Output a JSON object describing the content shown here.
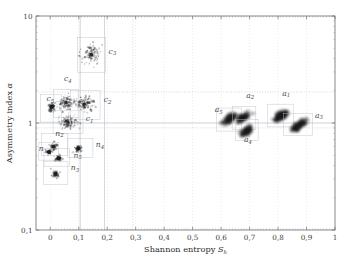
{
  "chart_data": {
    "type": "scatter",
    "title": "",
    "xlabel": "Shannon entropy S_h",
    "ylabel": "Asymmetry index α",
    "xlabel_main": "Shannon entropy",
    "xlabel_sym": "S",
    "xlabel_sub": "h",
    "ylabel_main": "Asymmetry index",
    "ylabel_sym": "α",
    "xlim": [
      -0.05,
      1.0
    ],
    "ylim": [
      0.1,
      10
    ],
    "yscale": "log",
    "xscale": "linear",
    "grid": true,
    "legend": "none",
    "xticks": [
      "0",
      "0,1",
      "0,2",
      "0,3",
      "0,4",
      "0,5",
      "0,6",
      "0,7",
      "0,8",
      "0,9",
      "1"
    ],
    "xtickvals": [
      0,
      0.1,
      0.2,
      0.3,
      0.4,
      0.5,
      0.6,
      0.7,
      0.8,
      0.9,
      1.0
    ],
    "yticks": [
      "0,1",
      "1",
      "10"
    ],
    "ytickvals": [
      0.1,
      1,
      10
    ],
    "reference_lines": [
      {
        "axis": "y",
        "value": 1.0,
        "style": "solid"
      },
      {
        "axis": "y",
        "value": 0.9,
        "style": "dotted"
      },
      {
        "axis": "y",
        "value": 1.95,
        "style": "dotted"
      },
      {
        "axis": "x",
        "value": 0.105,
        "style": "solid"
      },
      {
        "axis": "x",
        "value": 0.19,
        "style": "solid"
      },
      {
        "axis": "x",
        "value": 0.29,
        "style": "dotted"
      }
    ],
    "clusters": [
      {
        "id": "c3",
        "label": "c",
        "sub": "3",
        "x": 0.145,
        "y": 4.35,
        "box": [
          0.095,
          2.95,
          0.195,
          6.3
        ],
        "lx": 0.205,
        "ly": 4.45,
        "kind": "streak",
        "spread": 0.03,
        "n": 120
      },
      {
        "id": "c4",
        "label": "c",
        "sub": "4",
        "x": 0.055,
        "y": 1.55,
        "box": [
          0.012,
          1.12,
          0.098,
          2.05
        ],
        "lx": 0.048,
        "ly": 2.45,
        "kind": "streak",
        "spread": 0.026,
        "n": 110
      },
      {
        "id": "c5",
        "label": "c",
        "sub": "5",
        "x": 0.005,
        "y": 1.42,
        "box": [
          -0.035,
          1.02,
          0.04,
          1.85
        ],
        "lx": -0.013,
        "ly": 1.6,
        "kind": "blob",
        "spread": 0.016,
        "n": 70
      },
      {
        "id": "c2",
        "label": "c",
        "sub": "2",
        "x": 0.12,
        "y": 1.5,
        "box": [
          0.072,
          1.08,
          0.175,
          2.02
        ],
        "lx": 0.188,
        "ly": 1.56,
        "kind": "streak",
        "spread": 0.03,
        "n": 130
      },
      {
        "id": "c1",
        "label": "c",
        "sub": "1",
        "x": 0.062,
        "y": 1.02,
        "box": [
          0.01,
          0.8,
          0.115,
          1.3
        ],
        "lx": 0.125,
        "ly": 1.04,
        "kind": "streak",
        "spread": 0.026,
        "n": 120
      },
      {
        "id": "n2",
        "label": "n",
        "sub": "2",
        "x": 0.012,
        "y": 0.6,
        "box": [
          -0.03,
          0.5,
          0.062,
          0.8
        ],
        "lx": 0.018,
        "ly": 0.76,
        "kind": "point",
        "spread": 0.01,
        "n": 40
      },
      {
        "id": "n1",
        "label": "n",
        "sub": "1",
        "x": -0.004,
        "y": 0.535,
        "box": [
          -0.04,
          0.45,
          0.03,
          0.66
        ],
        "lx": -0.04,
        "ly": 0.545,
        "kind": "point",
        "spread": 0.009,
        "n": 35
      },
      {
        "id": "n5",
        "label": "n",
        "sub": "5",
        "x": 0.03,
        "y": 0.465,
        "box": [
          -0.022,
          0.395,
          0.068,
          0.58
        ],
        "lx": 0.082,
        "ly": 0.475,
        "kind": "point",
        "spread": 0.01,
        "n": 45
      },
      {
        "id": "n4",
        "label": "n",
        "sub": "4",
        "x": 0.098,
        "y": 0.575,
        "box": [
          0.06,
          0.475,
          0.15,
          0.72
        ],
        "lx": 0.16,
        "ly": 0.595,
        "kind": "point",
        "spread": 0.012,
        "n": 50
      },
      {
        "id": "n3",
        "label": "n",
        "sub": "3",
        "x": 0.018,
        "y": 0.335,
        "box": [
          -0.024,
          0.265,
          0.062,
          0.44
        ],
        "lx": 0.072,
        "ly": 0.36,
        "kind": "point",
        "spread": 0.01,
        "n": 40
      },
      {
        "id": "a5",
        "label": "a",
        "sub": "5",
        "x": 0.63,
        "y": 1.09,
        "box": [
          0.583,
          0.84,
          0.672,
          1.38
        ],
        "lx": 0.578,
        "ly": 1.26,
        "kind": "cloud",
        "spread": 0.022,
        "n": 200
      },
      {
        "id": "a2",
        "label": "a",
        "sub": "2",
        "x": 0.678,
        "y": 1.13,
        "box": [
          0.64,
          0.87,
          0.722,
          1.42
        ],
        "lx": 0.688,
        "ly": 1.72,
        "kind": "cloud",
        "spread": 0.022,
        "n": 200
      },
      {
        "id": "a4",
        "label": "a",
        "sub": "4",
        "x": 0.69,
        "y": 0.845,
        "box": [
          0.65,
          0.69,
          0.73,
          1.08
        ],
        "lx": 0.68,
        "ly": 0.66,
        "kind": "cloud",
        "spread": 0.02,
        "n": 180
      },
      {
        "id": "a1",
        "label": "a",
        "sub": "1",
        "x": 0.81,
        "y": 1.17,
        "box": [
          0.762,
          0.92,
          0.855,
          1.5
        ],
        "lx": 0.815,
        "ly": 1.8,
        "kind": "cloud",
        "spread": 0.024,
        "n": 220
      },
      {
        "id": "a3",
        "label": "a",
        "sub": "3",
        "x": 0.872,
        "y": 0.95,
        "box": [
          0.82,
          0.76,
          0.92,
          1.22
        ],
        "lx": 0.93,
        "ly": 1.12,
        "kind": "cloud",
        "spread": 0.026,
        "n": 220
      }
    ]
  },
  "axes": {
    "x_label_text": "Shannon entropy",
    "x_label_symbol": "S",
    "x_label_subscript": "h",
    "y_label_text": "Asymmetry index",
    "y_label_symbol": "α"
  },
  "colors": {
    "frame": "#6b6b6b",
    "grid": "#9aa5b1",
    "grid_dotted": "#9aa5b1",
    "cluster_box": "#b8c0c8",
    "data": "#1a1a1a",
    "text": "#2b2b2b",
    "background": "#ffffff"
  }
}
